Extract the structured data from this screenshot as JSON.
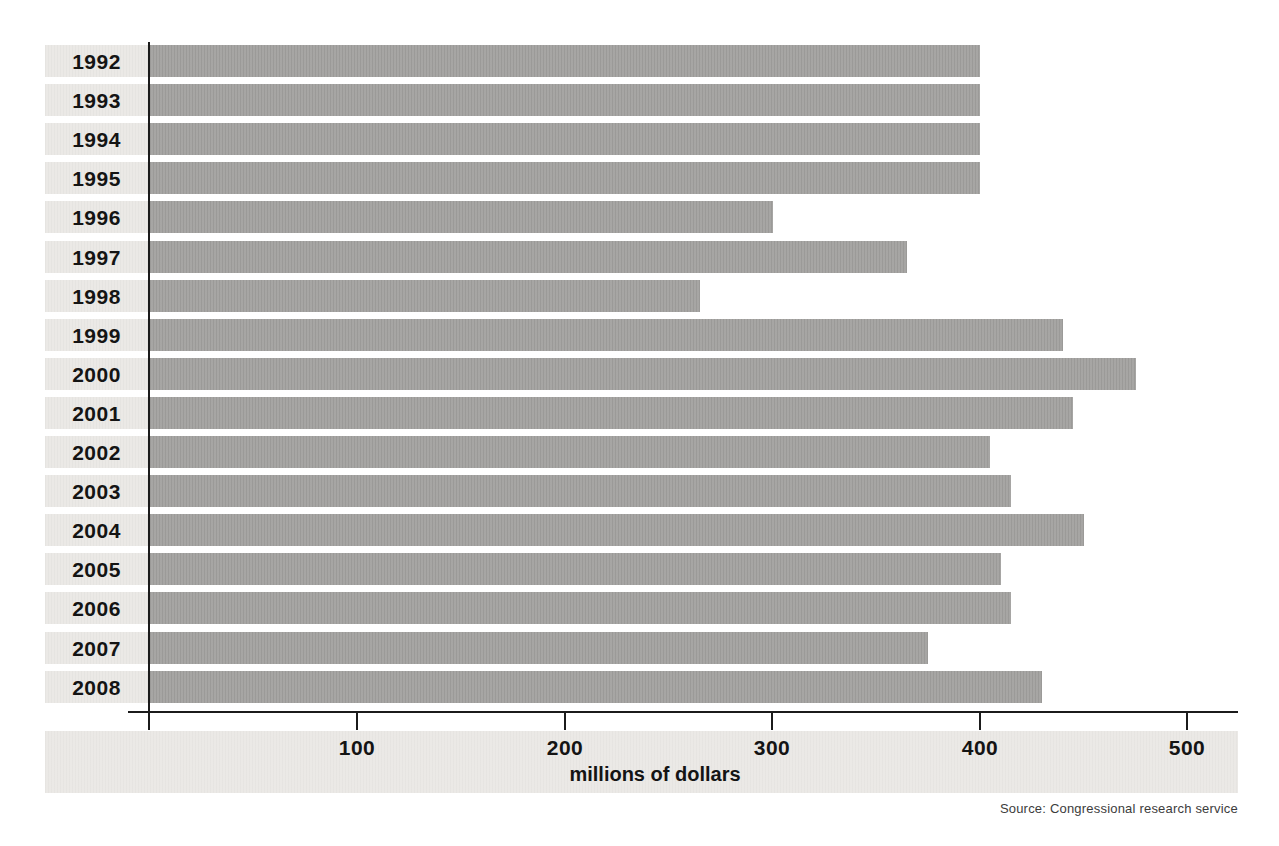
{
  "chart_data": {
    "type": "bar",
    "orientation": "horizontal",
    "title": "",
    "xlabel": "millions of dollars",
    "ylabel": "",
    "categories": [
      "1992",
      "1993",
      "1994",
      "1995",
      "1996",
      "1997",
      "1998",
      "1999",
      "2000",
      "2001",
      "2002",
      "2003",
      "2004",
      "2005",
      "2006",
      "2007",
      "2008"
    ],
    "values": [
      400,
      400,
      400,
      400,
      300,
      365,
      265,
      440,
      475,
      445,
      405,
      415,
      450,
      410,
      415,
      375,
      430
    ],
    "xlim": [
      0,
      525
    ],
    "xticks": [
      100,
      200,
      300,
      400,
      500
    ],
    "xtick_labels": [
      "100",
      "200",
      "300",
      "400",
      "500"
    ],
    "grid": false,
    "legend": null,
    "bar_color": "#a3a2a0",
    "label_band_color": "#ebe9e6",
    "axis_color": "#1b1b1b",
    "source": "Source: Congressional research service"
  },
  "footer": {
    "xlabel": "millions of dollars",
    "source_note": "Source: Congressional research service"
  }
}
